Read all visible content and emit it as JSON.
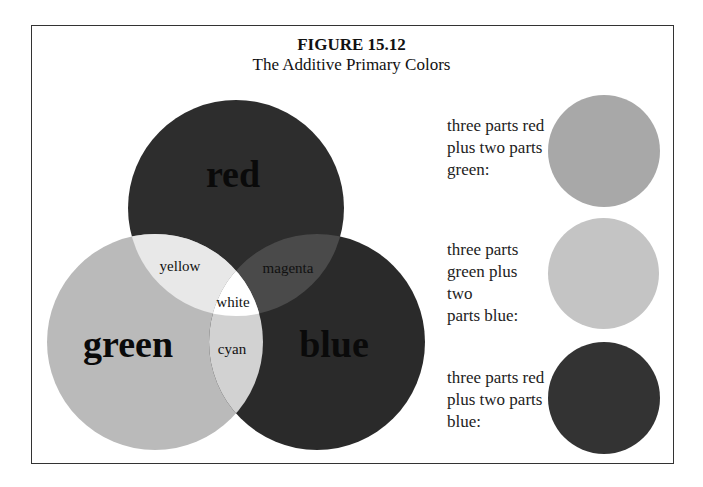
{
  "figure": {
    "number": "FIGURE 15.12",
    "title": "The Additive Primary Colors"
  },
  "venn": {
    "circles": [
      {
        "name": "red",
        "label": "red",
        "cx": 236,
        "cy": 208,
        "r": 108,
        "fill": "#2d2d2d"
      },
      {
        "name": "green",
        "label": "green",
        "cx": 155,
        "cy": 342,
        "r": 108,
        "fill": "#bababa"
      },
      {
        "name": "blue",
        "label": "blue",
        "cx": 317,
        "cy": 342,
        "r": 108,
        "fill": "#2a2a2a"
      }
    ],
    "overlaps": {
      "yellow": {
        "label": "yellow",
        "fill": "#e8e8e8"
      },
      "magenta": {
        "label": "magenta",
        "fill": "#4a4a4a"
      },
      "cyan": {
        "label": "cyan",
        "fill": "#d2d2d2"
      },
      "white": {
        "label": "white",
        "fill": "#ffffff"
      }
    }
  },
  "mixtures": [
    {
      "text": "three parts red plus two parts green:",
      "lines": [
        "three parts red",
        "plus two parts",
        "green:"
      ],
      "color": "#a8a8a8"
    },
    {
      "text": "three parts green plus two parts blue:",
      "lines": [
        "three parts",
        "green plus two",
        "parts blue:"
      ],
      "color": "#c4c4c4"
    },
    {
      "text": "three parts red plus two parts blue:",
      "lines": [
        "three parts red",
        "plus two parts",
        "blue:"
      ],
      "color": "#333333"
    }
  ]
}
